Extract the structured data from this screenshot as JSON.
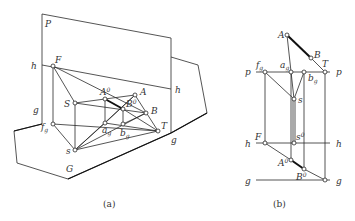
{
  "figure_a": {
    "caption": "(a)",
    "labels": {
      "P": "P",
      "h_left": "h",
      "h_right": "h",
      "g_left": "g",
      "g_right": "g",
      "F": "F",
      "S": "S",
      "f": "f",
      "f_sub": "g",
      "s": "s",
      "G": "G",
      "A0": "A",
      "A0_sup": "0",
      "A": "A",
      "B0": "B",
      "B0_sup": "0",
      "B": "B",
      "a": "a",
      "a_sub": "g",
      "b": "b",
      "b_sub": "g",
      "T": "T"
    }
  },
  "figure_b": {
    "caption": "(b)",
    "labels": {
      "A": "A",
      "B": "B",
      "p_left": "p",
      "p_right": "p",
      "f": "f",
      "f_sub": "g",
      "a": "a",
      "a_sub": "g",
      "b": "b",
      "b_sub": "g",
      "T": "T",
      "s": "s",
      "F": "F",
      "s0": "s",
      "s0_sup": "0",
      "h_left": "h",
      "h_right": "h",
      "A0": "A",
      "A0_sup": "0",
      "B0": "B",
      "B0_sup": "0",
      "g_left": "g",
      "g_right": "g"
    }
  }
}
